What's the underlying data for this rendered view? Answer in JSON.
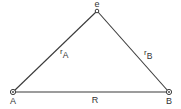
{
  "diagram": {
    "title": "",
    "colors": {
      "line": "#3a3a3a",
      "text": "#333333",
      "background": "#ffffff"
    },
    "nodes": [
      {
        "id": "e",
        "label": "e",
        "x": 97,
        "y": 11,
        "symbol": "small-circle"
      },
      {
        "id": "A",
        "label": "A",
        "x": 13,
        "y": 92,
        "symbol": "circled-dot"
      },
      {
        "id": "B",
        "label": "B",
        "x": 169,
        "y": 92,
        "symbol": "circled-dot"
      }
    ],
    "edges": [
      {
        "from": "A",
        "to": "e",
        "label_main": "r",
        "label_sub": "A"
      },
      {
        "from": "e",
        "to": "B",
        "label_main": "r",
        "label_sub": "B"
      },
      {
        "from": "A",
        "to": "B",
        "label_main": "R",
        "label_sub": ""
      }
    ]
  }
}
